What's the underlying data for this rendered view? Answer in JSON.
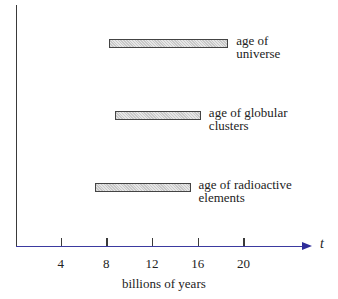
{
  "chart_data": {
    "type": "bar",
    "orientation": "horizontal-range",
    "title": "",
    "xlabel": "billions of years",
    "axis_variable": "t",
    "x_ticks": [
      4,
      8,
      12,
      16,
      20
    ],
    "xlim": [
      0,
      24
    ],
    "grid": false,
    "series": [
      {
        "name": "age of universe",
        "label_lines": [
          "age of",
          "universe"
        ],
        "start": 8.2,
        "end": 18.5
      },
      {
        "name": "age of globular clusters",
        "label_lines": [
          "age of globular",
          "clusters"
        ],
        "start": 8.8,
        "end": 16.1
      },
      {
        "name": "age of radioactive elements",
        "label_lines": [
          "age of radioactive",
          "elements"
        ],
        "start": 7.0,
        "end": 15.2
      }
    ]
  },
  "colors": {
    "axis": "#3b3aa0",
    "bar_fill": "#d4d4d4",
    "bar_border": "#444444"
  }
}
